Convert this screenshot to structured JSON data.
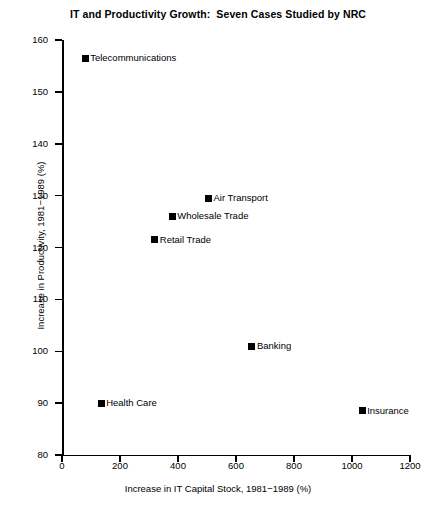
{
  "chart_data": {
    "type": "scatter",
    "title": "IT and Productivity Growth:  Seven Cases Studied by NRC",
    "xlabel": "Increase in IT Capital Stock, 1981−1989 (%)",
    "ylabel": "Increase in Productivity, 1981−1989 (%)",
    "xlim": [
      0,
      1200
    ],
    "ylim": [
      80,
      160
    ],
    "xticks": [
      0,
      200,
      400,
      600,
      800,
      1000,
      1200
    ],
    "yticks": [
      80,
      90,
      100,
      110,
      120,
      130,
      140,
      150,
      160
    ],
    "xtick_labels": [
      "0",
      "200",
      "400",
      "600",
      "800",
      "1000",
      "1200"
    ],
    "ytick_labels": [
      "80",
      "90",
      "100",
      "110",
      "120",
      "130",
      "140",
      "150",
      "160"
    ],
    "grid": false,
    "legend": "none",
    "marker_color": "#000000",
    "marker_shape": "square",
    "points": [
      {
        "label": "Telecommunications",
        "x": 80,
        "y": 156.5
      },
      {
        "label": "Air Transport",
        "x": 505,
        "y": 129.5
      },
      {
        "label": "Wholesale Trade",
        "x": 380,
        "y": 126.0
      },
      {
        "label": "Retail Trade",
        "x": 320,
        "y": 121.5
      },
      {
        "label": "Banking",
        "x": 655,
        "y": 101.0
      },
      {
        "label": "Health Care",
        "x": 135,
        "y": 90.0
      },
      {
        "label": "Insurance",
        "x": 1035,
        "y": 88.5
      }
    ]
  }
}
